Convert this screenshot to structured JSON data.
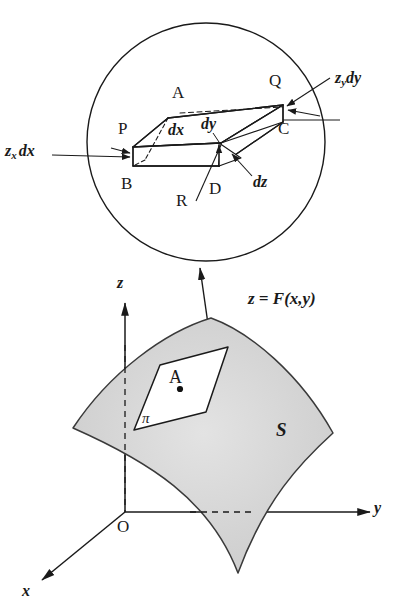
{
  "figure": {
    "background_color": "#ffffff",
    "line_color": "#1a1a1a",
    "surface_fill": "#d8d8d8",
    "inset_fill": "#ffffff"
  },
  "inset": {
    "description": "Magnified circular inset showing the infinitesimal parallelogram element PQCB with height dz",
    "vertices": {
      "P": "P",
      "Q": "Q",
      "C": "C",
      "B": "B",
      "D": "D",
      "R": "R",
      "A": "A"
    },
    "edges": {
      "dx": "dx",
      "dy": "dy",
      "dz": "dz"
    },
    "callouts": {
      "left": {
        "base": "z",
        "subscript": "x",
        "differential": "dx"
      },
      "right": {
        "base": "z",
        "subscript": "y",
        "differential": "dy"
      }
    }
  },
  "surface": {
    "equation": "z = F(x,y)",
    "surface_label": "S",
    "plane_label": "π",
    "point_label": "A",
    "origin_label": "O",
    "axes": {
      "z": "z",
      "y": "y",
      "x": "x"
    }
  }
}
